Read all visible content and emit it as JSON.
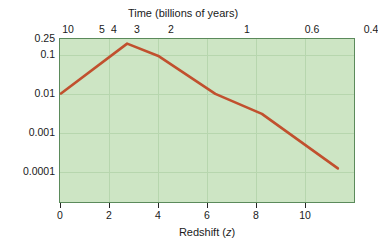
{
  "chart_data": {
    "type": "line",
    "title": "Time (billions of years)",
    "xlabel": "Redshift (z)",
    "ylabel": "M⊙ /yr/Mpc",
    "yscale": "log",
    "ylim": [
      4e-05,
      0.25
    ],
    "xlim": [
      0,
      12
    ],
    "grid": true,
    "legend": "none",
    "y_tick_labels": [
      "0.25",
      "0.1",
      "0.01",
      "0.001",
      "0.0001"
    ],
    "y_tick_values": [
      0.25,
      0.1,
      0.01,
      0.001,
      0.0001
    ],
    "x_tick_labels": [
      "0",
      "2",
      "4",
      "6",
      "8",
      "10"
    ],
    "x_tick_values": [
      0,
      2,
      4,
      6,
      8,
      10
    ],
    "top_axis_label": "Time (billions of years)",
    "top_tick_labels": [
      "10",
      "5",
      "4",
      "3",
      "2",
      "1",
      "0.6",
      "0.4"
    ],
    "top_tick_values": [
      10,
      5,
      4,
      3,
      2,
      1,
      0.6,
      0.4
    ],
    "series": [
      {
        "name": "Cosmic star formation rate density",
        "color": "#c1502e",
        "x": [
          0,
          2.7,
          4.0,
          6.3,
          8.2,
          11.3
        ],
        "y": [
          0.01,
          0.19,
          0.09,
          0.0098,
          0.003,
          0.00012
        ]
      }
    ]
  },
  "axes": {
    "top": {
      "title": "Time (billions of years)",
      "ticks": [
        {
          "label": "10",
          "x": 9
        },
        {
          "label": "5",
          "x": 43
        },
        {
          "label": "4",
          "x": 55
        },
        {
          "label": "3",
          "x": 78
        },
        {
          "label": "2",
          "x": 112
        },
        {
          "label": "1",
          "x": 188
        },
        {
          "label": "0.6",
          "x": 253
        },
        {
          "label": "0.4",
          "x": 312
        }
      ]
    },
    "bottom": {
      "title_prefix": "Redshift (",
      "title_italic": "z",
      "title_suffix": ")",
      "ticks": [
        {
          "label": "0",
          "x": 1
        },
        {
          "label": "2",
          "x": 50
        },
        {
          "label": "4",
          "x": 99
        },
        {
          "label": "6",
          "x": 148
        },
        {
          "label": "8",
          "x": 197
        },
        {
          "label": "10",
          "x": 246
        }
      ]
    },
    "left": {
      "title_main": "M",
      "title_sub": "⊙",
      "title_rest": " /yr/Mpc",
      "ticks": [
        {
          "label": "0.25",
          "y": 0
        },
        {
          "label": "0.1",
          "y": 16
        },
        {
          "label": "0.01",
          "y": 55
        },
        {
          "label": "0.001",
          "y": 94
        },
        {
          "label": "0.0001",
          "y": 133
        }
      ]
    }
  },
  "colors": {
    "plot_background": "#cde5c4",
    "plot_border": "#5b8a5b",
    "gridline": "#b7d6ae",
    "curve": "#c1502e",
    "text": "#1a1a1a"
  }
}
